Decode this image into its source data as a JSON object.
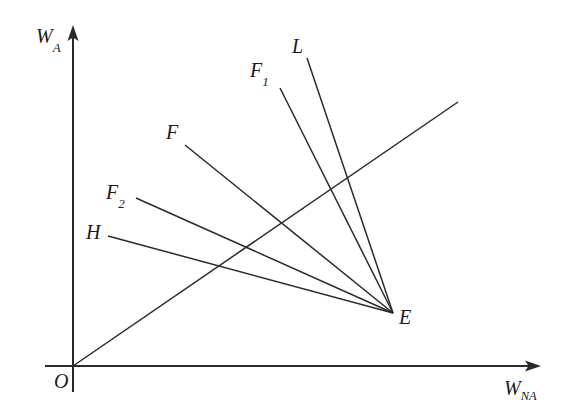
{
  "figure": {
    "type": "diagram",
    "background_color": "#ffffff",
    "line_color": "#2a2a2a",
    "axes": {
      "vertical": {
        "label_base": "W",
        "label_subscript": "A",
        "label_full": "WA",
        "arrow": "up-arrow-icon",
        "x": 73,
        "y_top": 28,
        "y_bottom": 392,
        "label_x": 36,
        "label_y": 26
      },
      "horizontal": {
        "label_base": "W",
        "label_subscript": "NA",
        "label_full": "WNA",
        "arrow": "right-arrow-icon",
        "y": 366,
        "x_left": 45,
        "x_right": 540,
        "label_x": 504,
        "label_y": 378
      }
    },
    "origin": {
      "label": "O",
      "x": 73,
      "y": 366,
      "label_x": 54,
      "label_y": 371
    },
    "convergence_point": {
      "label": "E",
      "x": 393,
      "y": 313,
      "label_x": 399,
      "label_y": 307
    },
    "rays": [
      {
        "label": "L",
        "label_base": "L",
        "label_subscript": "",
        "start_x": 307,
        "start_y": 58,
        "end_x": 393,
        "end_y": 313,
        "label_x": 292,
        "label_y": 36
      },
      {
        "label": "F1",
        "label_base": "F",
        "label_subscript": "1",
        "start_x": 280,
        "start_y": 88,
        "end_x": 393,
        "end_y": 313,
        "label_x": 250,
        "label_y": 60
      },
      {
        "label": "F",
        "label_base": "F",
        "label_subscript": "",
        "start_x": 185,
        "start_y": 145,
        "end_x": 393,
        "end_y": 313,
        "label_x": 166,
        "label_y": 122
      },
      {
        "label": "F2",
        "label_base": "F",
        "label_subscript": "2",
        "start_x": 136,
        "start_y": 198,
        "end_x": 393,
        "end_y": 313,
        "label_x": 106,
        "label_y": 182
      },
      {
        "label": "H",
        "label_base": "H",
        "label_subscript": "",
        "start_x": 108,
        "start_y": 236,
        "end_x": 393,
        "end_y": 313,
        "label_x": 86,
        "label_y": 222
      }
    ],
    "diagonal_ray": {
      "name": "expansion-path",
      "start_x": 73,
      "start_y": 366,
      "end_x": 458,
      "end_y": 102
    }
  }
}
